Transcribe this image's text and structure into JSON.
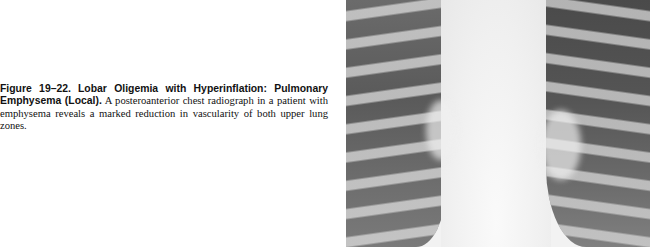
{
  "figure": {
    "label": "Figure 19–22.",
    "title": "Lobar Oligemia with Hyperinflation: Pulmonary Emphysema (Local).",
    "body": "A posteroanterior chest radiograph in a patient with emphysema reveals a marked reduction in vascularity of both upper lung zones."
  },
  "image": {
    "description": "Posteroanterior chest radiograph showing hyperinflated lungs with reduced upper-zone vascularity"
  }
}
